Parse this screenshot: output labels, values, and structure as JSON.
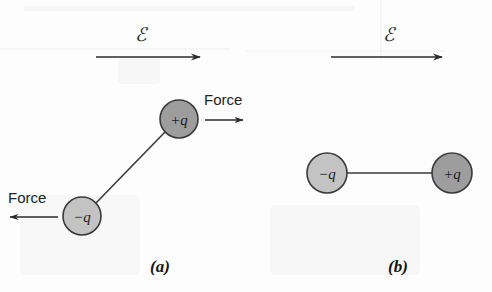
{
  "figure": {
    "background_color": "#fdfdfd",
    "stroke_color": "#2b2b2b"
  },
  "panels": [
    {
      "id": "a",
      "caption": "(a)",
      "field": {
        "symbol": "ℰ",
        "symbol_name": "script-e-electric-field",
        "direction": "right"
      },
      "charges": [
        {
          "id": "a-positive",
          "label": "+q",
          "sign": "positive",
          "fill": "#9d9d9d",
          "stroke": "#3a3a3a",
          "cx": 179,
          "cy": 119,
          "r": 19
        },
        {
          "id": "a-negative",
          "label": "−q",
          "sign": "negative",
          "fill": "#c3c3c3",
          "stroke": "#3a3a3a",
          "cx": 82,
          "cy": 216,
          "r": 19
        }
      ],
      "forces": [
        {
          "id": "a-force-positive",
          "label": "Force",
          "direction": "right"
        },
        {
          "id": "a-force-negative",
          "label": "Force",
          "direction": "left"
        }
      ],
      "orientation": "tilted dipole, negative charge lower-left, positive charge upper-right"
    },
    {
      "id": "b",
      "caption": "(b)",
      "field": {
        "symbol": "ℰ",
        "symbol_name": "script-e-electric-field",
        "direction": "right"
      },
      "charges": [
        {
          "id": "b-negative",
          "label": "−q",
          "sign": "negative",
          "fill": "#c3c3c3",
          "stroke": "#3a3a3a",
          "cx": 327,
          "cy": 173,
          "r": 20
        },
        {
          "id": "b-positive",
          "label": "+q",
          "sign": "positive",
          "fill": "#9d9d9d",
          "stroke": "#3a3a3a",
          "cx": 452,
          "cy": 173,
          "r": 20
        }
      ],
      "forces": [],
      "orientation": "dipole aligned with the field, negative charge left, positive charge right"
    }
  ]
}
